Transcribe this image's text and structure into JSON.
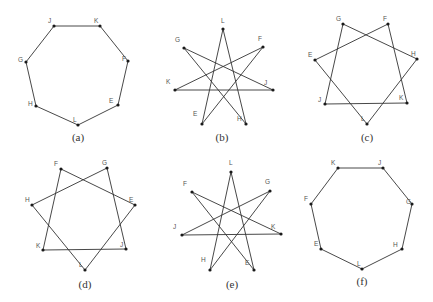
{
  "figures": [
    {
      "caption": "(a)",
      "caption_pos": [
        78,
        141
      ],
      "vertices": {
        "J": [
          54,
          26
        ],
        "K": [
          100,
          26
        ],
        "F": [
          128,
          61
        ],
        "E": [
          118,
          105
        ],
        "L": [
          78,
          125
        ],
        "H": [
          36,
          106
        ],
        "G": [
          26,
          62
        ]
      },
      "label_offsets": {
        "J": [
          -6,
          -3
        ],
        "K": [
          -6,
          -3
        ],
        "F": [
          -6,
          0
        ],
        "E": [
          -9,
          -2
        ],
        "L": [
          -5,
          -3
        ],
        "H": [
          -8,
          0
        ],
        "G": [
          -8,
          0
        ]
      },
      "edges": [
        [
          "J",
          "K"
        ],
        [
          "K",
          "F"
        ],
        [
          "F",
          "E"
        ],
        [
          "E",
          "L"
        ],
        [
          "L",
          "H"
        ],
        [
          "H",
          "G"
        ],
        [
          "G",
          "J"
        ]
      ]
    },
    {
      "caption": "(b)",
      "caption_pos": [
        222,
        141
      ],
      "vertices": {
        "L": [
          223,
          29
        ],
        "F": [
          263,
          47
        ],
        "J": [
          273,
          90
        ],
        "H": [
          246,
          124
        ],
        "E": [
          202,
          124
        ],
        "K": [
          175,
          90
        ],
        "G": [
          184,
          48
        ]
      },
      "label_offsets": {
        "L": [
          -2,
          -6
        ],
        "F": [
          -5,
          -6
        ],
        "J": [
          -9,
          -5
        ],
        "H": [
          -9,
          -3
        ],
        "E": [
          -9,
          -8
        ],
        "K": [
          -9,
          -6
        ],
        "G": [
          -9,
          -6
        ]
      },
      "edges": [
        [
          "L",
          "H"
        ],
        [
          "H",
          "G"
        ],
        [
          "G",
          "J"
        ],
        [
          "J",
          "K"
        ],
        [
          "K",
          "F"
        ],
        [
          "F",
          "E"
        ],
        [
          "E",
          "L"
        ]
      ]
    },
    {
      "caption": "(c)",
      "caption_pos": [
        367,
        141
      ],
      "vertices": {
        "G": [
          343,
          24
        ],
        "F": [
          388,
          24
        ],
        "H": [
          417,
          59
        ],
        "K": [
          407,
          103
        ],
        "L": [
          367,
          124
        ],
        "J": [
          325,
          104
        ],
        "E": [
          315,
          60
        ]
      },
      "label_offsets": {
        "G": [
          -7,
          -3
        ],
        "F": [
          -5,
          -3
        ],
        "H": [
          -6,
          -3
        ],
        "K": [
          -8,
          -3
        ],
        "L": [
          -6,
          -3
        ],
        "J": [
          -7,
          -2
        ],
        "E": [
          -7,
          -3
        ]
      },
      "edges": [
        [
          "G",
          "H"
        ],
        [
          "H",
          "L"
        ],
        [
          "L",
          "E"
        ],
        [
          "E",
          "F"
        ],
        [
          "F",
          "K"
        ],
        [
          "K",
          "J"
        ],
        [
          "J",
          "G"
        ]
      ]
    },
    {
      "caption": "(d)",
      "caption_pos": [
        85,
        288
      ],
      "vertices": {
        "F": [
          61,
          169
        ],
        "G": [
          107,
          168
        ],
        "E": [
          135,
          205
        ],
        "J": [
          126,
          249
        ],
        "L": [
          85,
          270
        ],
        "K": [
          43,
          250
        ],
        "H": [
          32,
          205
        ]
      },
      "label_offsets": {
        "F": [
          -7,
          -3
        ],
        "G": [
          -5,
          -3
        ],
        "E": [
          -6,
          -3
        ],
        "J": [
          -6,
          -2
        ],
        "L": [
          -6,
          -3
        ],
        "K": [
          -7,
          -2
        ],
        "H": [
          -7,
          -3
        ]
      },
      "edges": [
        [
          "F",
          "E"
        ],
        [
          "E",
          "L"
        ],
        [
          "L",
          "H"
        ],
        [
          "H",
          "G"
        ],
        [
          "G",
          "J"
        ],
        [
          "J",
          "K"
        ],
        [
          "K",
          "F"
        ]
      ]
    },
    {
      "caption": "(e)",
      "caption_pos": [
        232,
        288
      ],
      "vertices": {
        "L": [
          231,
          172
        ],
        "G": [
          270,
          191
        ],
        "K": [
          281,
          234
        ],
        "E": [
          254,
          270
        ],
        "H": [
          210,
          270
        ],
        "J": [
          182,
          235
        ],
        "F": [
          192,
          192
        ]
      },
      "label_offsets": {
        "L": [
          -2,
          -7
        ],
        "G": [
          -5,
          -7
        ],
        "K": [
          -10,
          -5
        ],
        "E": [
          -9,
          -5
        ],
        "H": [
          -9,
          -8
        ],
        "J": [
          -9,
          -6
        ],
        "F": [
          -9,
          -6
        ]
      },
      "edges": [
        [
          "L",
          "H"
        ],
        [
          "H",
          "G"
        ],
        [
          "G",
          "J"
        ],
        [
          "J",
          "K"
        ],
        [
          "K",
          "F"
        ],
        [
          "F",
          "E"
        ],
        [
          "E",
          "L"
        ]
      ]
    },
    {
      "caption": "(f)",
      "caption_pos": [
        362,
        285
      ],
      "vertices": {
        "K": [
          338,
          168
        ],
        "J": [
          383,
          168
        ],
        "G": [
          412,
          204
        ],
        "H": [
          402,
          249
        ],
        "L": [
          362,
          269
        ],
        "E": [
          321,
          249
        ],
        "F": [
          311,
          204
        ]
      },
      "label_offsets": {
        "K": [
          -7,
          -3
        ],
        "J": [
          -5,
          -3
        ],
        "G": [
          -6,
          0
        ],
        "H": [
          -9,
          -2
        ],
        "L": [
          -5,
          -3
        ],
        "E": [
          -7,
          -3
        ],
        "F": [
          -7,
          -3
        ]
      },
      "edges": [
        [
          "K",
          "J"
        ],
        [
          "J",
          "G"
        ],
        [
          "G",
          "H"
        ],
        [
          "H",
          "L"
        ],
        [
          "L",
          "E"
        ],
        [
          "E",
          "F"
        ],
        [
          "F",
          "K"
        ]
      ]
    }
  ]
}
